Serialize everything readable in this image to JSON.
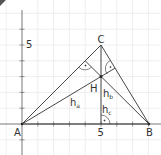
{
  "diagram": {
    "type": "geometry-triangle-altitudes",
    "grid_unit_px": 15.8,
    "origin_px": [
      22,
      124
    ],
    "colors": {
      "grid": "#e6e6e6",
      "axis": "#555555",
      "line": "#333333",
      "label": "#333333"
    },
    "axis_labels": {
      "x_tick": "5",
      "y_tick": "5"
    },
    "points": {
      "A": {
        "label": "A",
        "coords": [
          0,
          0
        ]
      },
      "B": {
        "label": "B",
        "coords": [
          8,
          0
        ]
      },
      "C": {
        "label": "C",
        "coords": [
          5,
          5
        ]
      },
      "H": {
        "label": "H",
        "coords": [
          5,
          3
        ]
      }
    },
    "altitudes": {
      "ha": {
        "label": "h",
        "sub": "a"
      },
      "hb": {
        "label": "h",
        "sub": "b"
      },
      "hc": {
        "label": "h",
        "sub": "c"
      }
    }
  }
}
